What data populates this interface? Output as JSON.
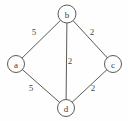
{
  "figure": {
    "background_color": "#fefefe",
    "stroke_color": "#5a5a58",
    "text_color": "#3b3b3a",
    "width": 128,
    "height": 121
  },
  "chart_data": {
    "type": "diagram",
    "diagram_kind": "weighted-undirected-graph",
    "title": "",
    "nodes": [
      {
        "id": "b",
        "label": "b",
        "x": 67,
        "y": 14,
        "r": 9
      },
      {
        "id": "a",
        "label": "a",
        "x": 16,
        "y": 64,
        "r": 8.5
      },
      {
        "id": "c",
        "label": "c",
        "x": 113,
        "y": 64,
        "r": 8.5
      },
      {
        "id": "d",
        "label": "d",
        "x": 66,
        "y": 108,
        "r": 8.5
      }
    ],
    "edges": [
      {
        "source": "a",
        "target": "b",
        "weight": "5",
        "label_x": 34,
        "label_y": 32
      },
      {
        "source": "b",
        "target": "c",
        "weight": "2",
        "label_x": 92,
        "label_y": 32
      },
      {
        "source": "b",
        "target": "d",
        "weight": "2",
        "label_x": 70,
        "label_y": 61
      },
      {
        "source": "a",
        "target": "d",
        "weight": "5",
        "label_x": 31,
        "label_y": 88
      },
      {
        "source": "c",
        "target": "d",
        "weight": "2",
        "label_x": 93,
        "label_y": 88
      }
    ]
  }
}
